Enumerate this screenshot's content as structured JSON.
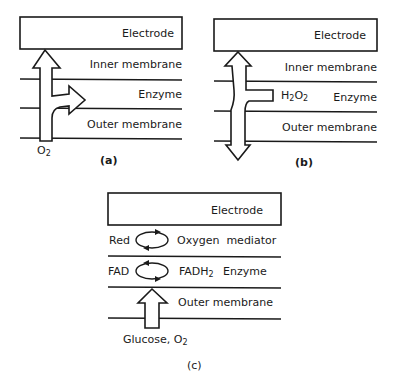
{
  "panels": [
    {
      "id": "a",
      "caption": "(a)",
      "layers": {
        "electrode": "Electrode",
        "inner": "Inner membrane",
        "enzyme": "Enzyme",
        "outer": "Outer membrane"
      },
      "species": {
        "base": "O",
        "sub": "2"
      }
    },
    {
      "id": "b",
      "caption": "(b)",
      "layers": {
        "electrode": "Electrode",
        "inner": "Inner membrane",
        "enzyme": "Enzyme",
        "outer": "Outer membrane"
      },
      "species": {
        "a": "H",
        "sub1": "2",
        "b": "O",
        "sub2": "2"
      }
    },
    {
      "id": "c",
      "caption": "(c)",
      "layers": {
        "electrode": "Electrode",
        "mediator_left": "Red",
        "mediator_right": "Oxygen  mediator",
        "enzyme_left": "FAD",
        "enzyme_right_base": "FADH",
        "enzyme_right_sub": "2",
        "enzyme_label": "Enzyme",
        "outer": "Outer membrane"
      },
      "species": {
        "text": "Glucose, O",
        "sub": "2"
      }
    }
  ],
  "colors": {
    "ink": "#1a1a1a",
    "background": "#ffffff"
  }
}
